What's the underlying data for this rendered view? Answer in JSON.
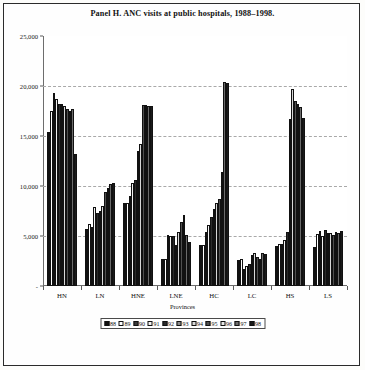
{
  "figure": {
    "title": "Panel H.  ANC visits at public hospitals, 1988–1998."
  },
  "axes": {
    "ylabel": "",
    "xlabel": "Provinces",
    "yticks": [
      "25,000",
      "20,000",
      "15,000",
      "10,000",
      "5,000",
      "-"
    ],
    "ytick_values": [
      25000,
      20000,
      15000,
      10000,
      5000,
      0
    ]
  },
  "legend": {
    "items": [
      {
        "label": "88",
        "fill": "#111111"
      },
      {
        "label": "89",
        "fill": "#ffffff"
      },
      {
        "label": "90",
        "fill": "#3a3a3a"
      },
      {
        "label": "91",
        "fill": "#f2f2f2"
      },
      {
        "label": "92",
        "fill": "#2a2a2a"
      },
      {
        "label": "93",
        "fill": "#8c8c8c"
      },
      {
        "label": "94",
        "fill": "#d8d8d8"
      },
      {
        "label": "95",
        "fill": "#4f4f4f"
      },
      {
        "label": "96",
        "fill": "#e8e8e8"
      },
      {
        "label": "97",
        "fill": "#6b6b6b"
      },
      {
        "label": "98",
        "fill": "#1a1a1a"
      }
    ]
  },
  "chart_data": {
    "type": "bar",
    "title": "Panel H.  ANC visits at public hospitals, 1988–1998.",
    "subtitle": "",
    "xlabel": "Provinces",
    "ylabel": "",
    "ylim": [
      0,
      25000
    ],
    "ytick_step": 5000,
    "grid": true,
    "legend_position": "bottom",
    "categories": [
      "HN",
      "LN",
      "HNE",
      "LNE",
      "HC",
      "LC",
      "HS",
      "LS"
    ],
    "series": [
      {
        "name": "88",
        "values": [
          15400,
          5700,
          8300,
          2700,
          4100,
          2650,
          4050,
          3900
        ]
      },
      {
        "name": "89",
        "values": [
          17500,
          6200,
          8350,
          2700,
          4150,
          2700,
          4200,
          5200
        ]
      },
      {
        "name": "90",
        "values": [
          19350,
          5900,
          9050,
          5100,
          5450,
          1750,
          4250,
          5550
        ]
      },
      {
        "name": "91",
        "values": [
          18750,
          7900,
          10350,
          5000,
          6100,
          2050,
          4600,
          5000
        ]
      },
      {
        "name": "92",
        "values": [
          18200,
          7350,
          10600,
          5050,
          6900,
          2250,
          5450,
          5600
        ]
      },
      {
        "name": "93",
        "values": [
          18250,
          7500,
          13500,
          4100,
          7700,
          3100,
          16700,
          5300
        ]
      },
      {
        "name": "94",
        "values": [
          18050,
          8000,
          14200,
          5400,
          8350,
          3350,
          19750,
          5300
        ]
      },
      {
        "name": "95",
        "values": [
          17700,
          9450,
          18100,
          6400,
          8750,
          2900,
          18500,
          5100
        ]
      },
      {
        "name": "96",
        "values": [
          17550,
          9850,
          18150,
          7150,
          11400,
          2700,
          18250,
          5400
        ]
      },
      {
        "name": "97",
        "values": [
          17750,
          10250,
          18050,
          5150,
          20450,
          3350,
          17950,
          5300
        ]
      },
      {
        "name": "98",
        "values": [
          13200,
          10300,
          18000,
          4400,
          20350,
          3200,
          16800,
          5500
        ]
      }
    ]
  }
}
